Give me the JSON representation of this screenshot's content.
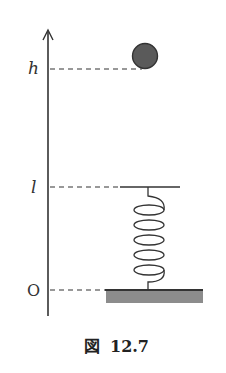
{
  "diagram": {
    "axis": {
      "label_top": "h",
      "label_mid": "l",
      "label_origin": "O"
    },
    "labels": {
      "h": "h",
      "l": "l",
      "origin": "O"
    },
    "elements": [
      "vertical axis with arrow",
      "ball at height h",
      "spring of natural length l",
      "fixed ground base"
    ],
    "colors": {
      "ball": "#5a5a5a",
      "ground": "#8c8c8c",
      "line": "#333333"
    }
  },
  "caption": {
    "prefix": "図",
    "number": "12.7"
  }
}
